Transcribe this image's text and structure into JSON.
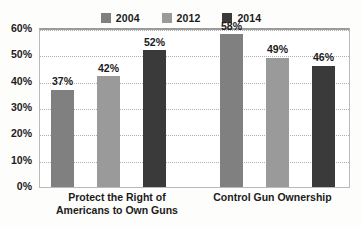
{
  "chart_data": {
    "type": "bar",
    "title": "",
    "subtitle": "",
    "xlabel": "",
    "ylabel": "",
    "categories": [
      "Protect the Right of\nAmericans to Own Guns",
      "Control Gun Ownership"
    ],
    "series": [
      {
        "name": "2004",
        "color": "#808080",
        "values": [
          37,
          58
        ],
        "labels": [
          "37%",
          "58%"
        ]
      },
      {
        "name": "2012",
        "color": "#9a9a9a",
        "values": [
          42,
          49
        ],
        "labels": [
          "42%",
          "49%"
        ]
      },
      {
        "name": "2014",
        "color": "#3a3a3a",
        "values": [
          52,
          46
        ],
        "labels": [
          "46%",
          "46%"
        ]
      }
    ],
    "series_values_by_category": [
      {
        "category": "Protect the Right of Americans to Own Guns",
        "2004": 37,
        "2012": 42,
        "2014": 52
      },
      {
        "category": "Control Gun Ownership",
        "2004": 58,
        "2012": 49,
        "2014": 46
      }
    ],
    "ylim": [
      0,
      60
    ],
    "ytick_step": 10,
    "yticks": [
      "0%",
      "10%",
      "20%",
      "30%",
      "40%",
      "50%",
      "60%"
    ],
    "ytick_values": [
      0,
      10,
      20,
      30,
      40,
      50,
      60
    ],
    "grid": true,
    "grid_style": "dotted",
    "legend_position": "top-center",
    "value_labels_shown": true,
    "unit": "%"
  },
  "legend": {
    "items": [
      {
        "label": "2004",
        "color": "#808080"
      },
      {
        "label": "2012",
        "color": "#9a9a9a"
      },
      {
        "label": "2014",
        "color": "#3a3a3a"
      }
    ]
  },
  "bars": [
    {
      "label": "37%",
      "value": 37,
      "color": "#808080",
      "series": "2004",
      "category": 0
    },
    {
      "label": "42%",
      "value": 42,
      "color": "#9a9a9a",
      "series": "2012",
      "category": 0
    },
    {
      "label": "52%",
      "value": 52,
      "color": "#3a3a3a",
      "series": "2014",
      "category": 0
    },
    {
      "label": "58%",
      "value": 58,
      "color": "#808080",
      "series": "2004",
      "category": 1
    },
    {
      "label": "49%",
      "value": 49,
      "color": "#9a9a9a",
      "series": "2012",
      "category": 1
    },
    {
      "label": "46%",
      "value": 46,
      "color": "#3a3a3a",
      "series": "2014",
      "category": 1
    }
  ],
  "category_labels": [
    "Protect the Right of\nAmericans to Own Guns",
    "Control Gun Ownership"
  ],
  "colors": {
    "plot_background": "#ffffff",
    "page_background": "#fdfdfc",
    "frame": "#b9b9b9",
    "frame_top": "#9b9b9b",
    "gridline": "#b0b0b0",
    "text": "#1b1b1b"
  }
}
